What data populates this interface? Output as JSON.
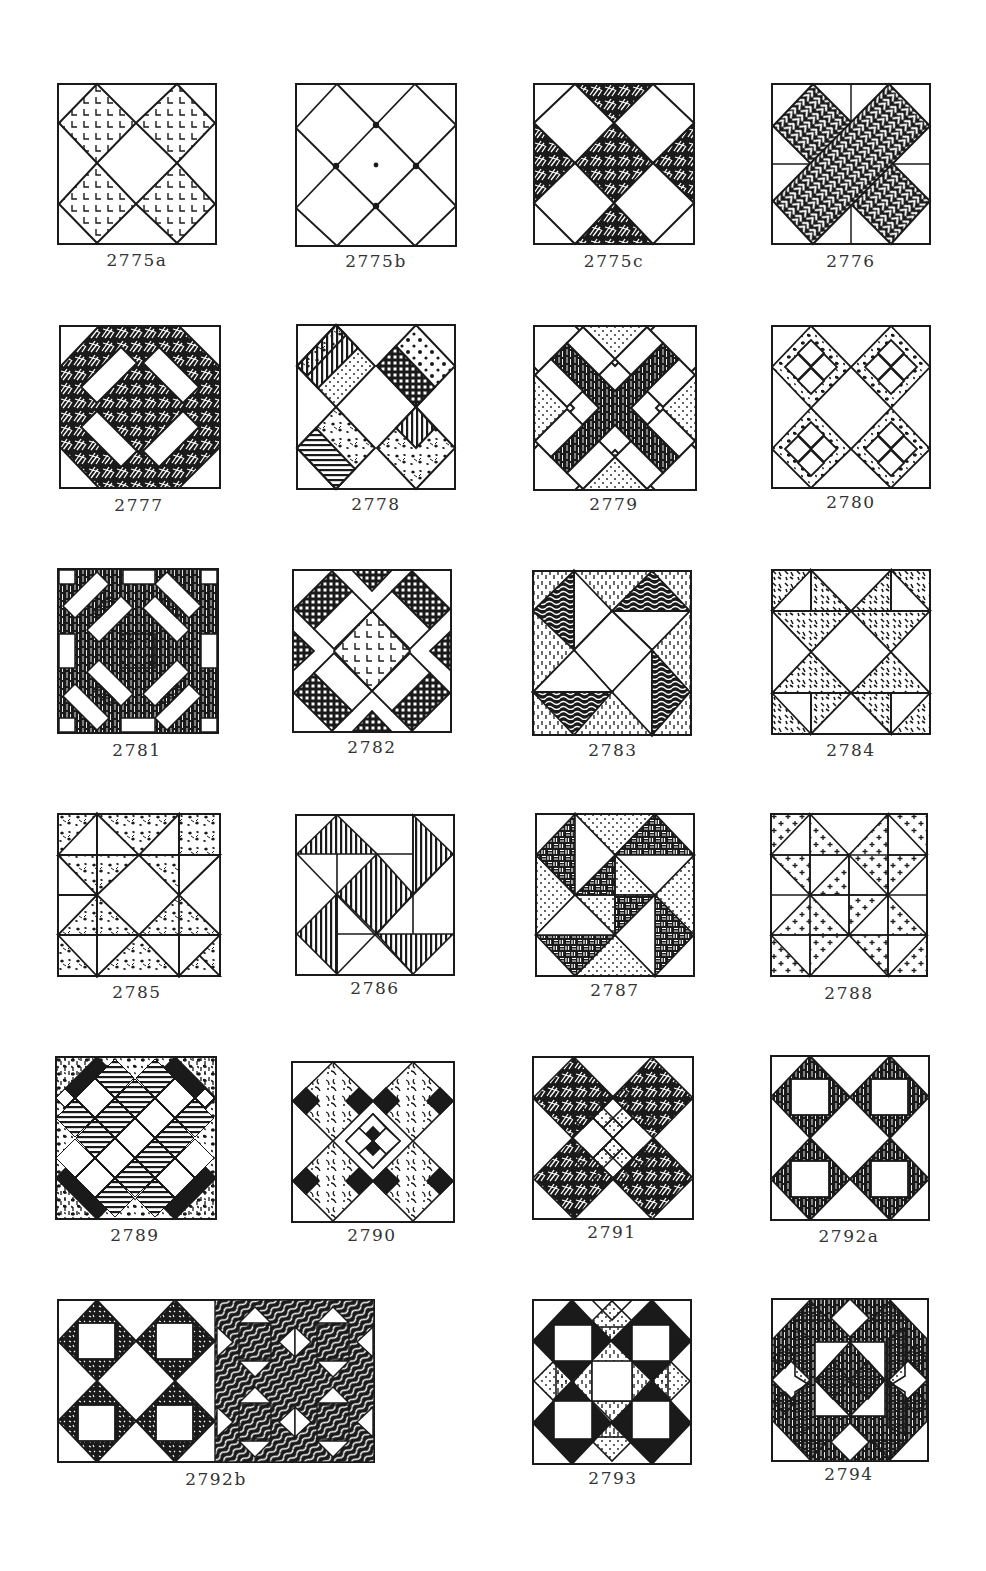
{
  "page": {
    "background": "#ffffff",
    "ink_color": "#1a1a1a",
    "label_color": "#333333"
  },
  "blocks": [
    {
      "id": "2775a",
      "label": "2775a",
      "row": 1,
      "col": 1,
      "description": "four-patch diamonds, L-shaped print on four diamonds"
    },
    {
      "id": "2775b",
      "label": "2775b",
      "row": 1,
      "col": 2,
      "description": "plain diamond grid with star-tack intersections"
    },
    {
      "id": "2775c",
      "label": "2775c",
      "row": 1,
      "col": 3,
      "description": "white diamonds with dark hatched triangles and center"
    },
    {
      "id": "2776",
      "label": "2776",
      "row": 1,
      "col": 4,
      "description": "X-cross of herringbone bars on four-patch background"
    },
    {
      "id": "2777",
      "label": "2777",
      "row": 2,
      "col": 1,
      "description": "octagon ring of dark print with four white rectangles"
    },
    {
      "id": "2778",
      "label": "2778",
      "row": 2,
      "col": 2,
      "description": "four striped diamonds of mixed prints around white center"
    },
    {
      "id": "2779",
      "label": "2779",
      "row": 2,
      "col": 3,
      "description": "dark X with white bars and dotted triangles"
    },
    {
      "id": "2780",
      "label": "2780",
      "row": 2,
      "col": 4,
      "description": "four nine-patch diamonds with spotted print"
    },
    {
      "id": "2781",
      "label": "2781",
      "row": 3,
      "col": 1,
      "description": "dark ground with white bars, spotted squares and center"
    },
    {
      "id": "2782",
      "label": "2782",
      "row": 3,
      "col": 2,
      "description": "cross-hatched bars, L-print center diamond"
    },
    {
      "id": "2783",
      "label": "2783",
      "row": 3,
      "col": 3,
      "description": "pinwheel of wood-grain and dashed triangles"
    },
    {
      "id": "2784",
      "label": "2784",
      "row": 3,
      "col": 4,
      "description": "hourglass star with speckled triangles"
    },
    {
      "id": "2785",
      "label": "2785",
      "row": 4,
      "col": 1,
      "description": "floral print star around white diamond"
    },
    {
      "id": "2786",
      "label": "2786",
      "row": 4,
      "col": 2,
      "description": "vertical-striped triangles pinwheel"
    },
    {
      "id": "2787",
      "label": "2787",
      "row": 4,
      "col": 3,
      "description": "basket-weave and dotted triangle pinwheel"
    },
    {
      "id": "2788",
      "label": "2788",
      "row": 4,
      "col": 4,
      "description": "cross-print half-square triangles"
    },
    {
      "id": "2789",
      "label": "2789",
      "row": 5,
      "col": 1,
      "description": "checkerboard diamonds with striped squares"
    },
    {
      "id": "2790",
      "label": "2790",
      "row": 5,
      "col": 2,
      "description": "X of black and white checks with leaf print"
    },
    {
      "id": "2791",
      "label": "2791",
      "row": 5,
      "col": 3,
      "description": "X of hatched and dotted checks"
    },
    {
      "id": "2792a",
      "label": "2792a",
      "row": 5,
      "col": 4,
      "description": "four striped diamonds with white squares"
    },
    {
      "id": "2792b",
      "label": "2792b",
      "row": 6,
      "col": 1,
      "description": "double-width: speckled diamonds with white squares, and wavy print variant"
    },
    {
      "id": "2793",
      "label": "2793",
      "row": 6,
      "col": 3,
      "description": "black corner triangles, dotted diamonds, white squares"
    },
    {
      "id": "2794",
      "label": "2794",
      "row": 6,
      "col": 4,
      "description": "framed diamond star with dotted and dark patches"
    }
  ]
}
